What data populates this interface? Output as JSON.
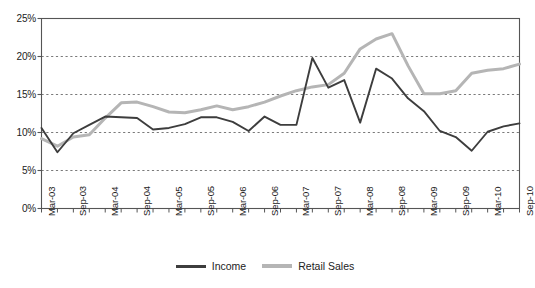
{
  "chart_data": {
    "type": "line",
    "title": "",
    "xlabel": "",
    "ylabel": "",
    "ylim": [
      0,
      25
    ],
    "yticks": [
      0,
      5,
      10,
      15,
      20,
      25
    ],
    "ytick_labels": [
      "0%",
      "5%",
      "10%",
      "15%",
      "20%",
      "25%"
    ],
    "grid": true,
    "grid_style": "dashed-horizontal",
    "legend_position": "bottom-center",
    "x": [
      "Mar-03",
      "Jun-03",
      "Sep-03",
      "Dec-03",
      "Mar-04",
      "Jun-04",
      "Sep-04",
      "Dec-04",
      "Mar-05",
      "Jun-05",
      "Sep-05",
      "Dec-05",
      "Mar-06",
      "Jun-06",
      "Sep-06",
      "Dec-06",
      "Mar-07",
      "Jun-07",
      "Sep-07",
      "Dec-07",
      "Mar-08",
      "Jun-08",
      "Sep-08",
      "Dec-08",
      "Mar-09",
      "Jun-09",
      "Sep-09",
      "Dec-09",
      "Mar-10",
      "Jun-10",
      "Sep-10"
    ],
    "xtick_labels": [
      "Mar-03",
      "Sep-03",
      "Mar-04",
      "Sep-04",
      "Mar-05",
      "Sep-05",
      "Mar-06",
      "Sep-06",
      "Mar-07",
      "Sep-07",
      "Mar-08",
      "Sep-08",
      "Mar-09",
      "Sep-09",
      "Mar-10",
      "Sep-10"
    ],
    "series": [
      {
        "name": "Income",
        "color": "#3d3d3d",
        "values": [
          10.6,
          7.4,
          9.9,
          11.0,
          12.1,
          12.0,
          11.9,
          10.4,
          10.6,
          11.1,
          12.0,
          12.0,
          11.4,
          10.2,
          12.1,
          11.0,
          11.0,
          19.8,
          15.9,
          16.9,
          11.3,
          18.4,
          17.1,
          14.5,
          12.8,
          10.2,
          9.4,
          7.6,
          10.1,
          10.8,
          11.2
        ]
      },
      {
        "name": "Retail Sales",
        "color": "#b5b5b5",
        "values": [
          9.2,
          8.2,
          9.4,
          9.7,
          11.9,
          13.9,
          14.0,
          13.4,
          12.7,
          12.6,
          13.0,
          13.5,
          13.0,
          13.4,
          14.0,
          14.8,
          15.5,
          16.0,
          16.3,
          17.8,
          21.0,
          22.3,
          23.0,
          18.8,
          15.1,
          15.1,
          15.5,
          17.8,
          18.2,
          18.4,
          19.0
        ]
      }
    ]
  },
  "legend": {
    "items": [
      {
        "label": "Income",
        "color": "#3d3d3d"
      },
      {
        "label": "Retail Sales",
        "color": "#b5b5b5"
      }
    ]
  },
  "axes": {
    "y_axis_color": "#555555",
    "x_axis_color": "#555555",
    "plot_border_color": "#555555"
  }
}
